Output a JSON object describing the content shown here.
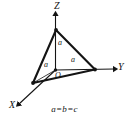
{
  "figure": {
    "caption": "a=b=c",
    "background_color": "#ffffff",
    "stroke_color": "#141414"
  },
  "axes": [
    {
      "id": "z",
      "label": "Z",
      "direction": "up"
    },
    {
      "id": "y",
      "label": "Y",
      "direction": "right"
    },
    {
      "id": "x",
      "label": "X",
      "direction": "down-left"
    }
  ],
  "origin": {
    "label": "O"
  },
  "intercepts": [
    {
      "axis": "z",
      "label": "a"
    },
    {
      "axis": "y",
      "label": "a"
    },
    {
      "axis": "x",
      "label": "a"
    }
  ],
  "relation": {
    "text": "a=b=c"
  }
}
